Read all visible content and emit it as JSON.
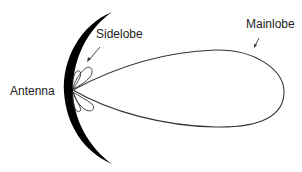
{
  "diagram": {
    "type": "antenna-radiation-pattern",
    "labels": {
      "antenna": "Antenna",
      "sidelobe": "Sidelobe",
      "mainlobe": "Mainlobe"
    },
    "colors": {
      "dish": "#000000",
      "outline": "#333333",
      "text": "#222222",
      "background": "#ffffff"
    },
    "components": [
      {
        "id": "antenna-dish",
        "shape": "crescent reflector"
      },
      {
        "id": "main-lobe",
        "shape": "elongated teardrop pointing right"
      },
      {
        "id": "side-lobes",
        "count": 4,
        "shape": "small petals near dish"
      }
    ]
  }
}
